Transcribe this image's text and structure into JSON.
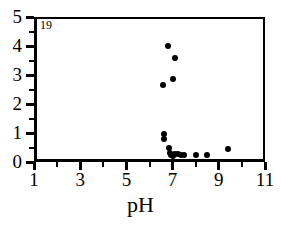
{
  "chart_data": {
    "type": "scatter",
    "title": "",
    "panel_label": "19",
    "xlabel": "pH",
    "ylabel": "",
    "xlim": [
      1,
      11
    ],
    "ylim": [
      0,
      5
    ],
    "grid": false,
    "legend": null,
    "x_ticks_major": [
      1,
      3,
      5,
      7,
      9,
      11
    ],
    "x_ticks_minor": [
      2,
      4,
      6,
      8,
      10
    ],
    "y_ticks_major": [
      0,
      1,
      2,
      3,
      4,
      5
    ],
    "y_ticks_minor": [
      0.5,
      1.5,
      2.5,
      3.5,
      4.5
    ],
    "x_tick_labels": [
      "1",
      "3",
      "5",
      "7",
      "9",
      "11"
    ],
    "y_tick_labels": [
      "0",
      "1",
      "2",
      "3",
      "4",
      "5"
    ],
    "marker": "filled-circle",
    "marker_color": "#000000",
    "points": [
      {
        "x": 6.8,
        "y": 4.0
      },
      {
        "x": 7.1,
        "y": 3.59
      },
      {
        "x": 7.0,
        "y": 2.85
      },
      {
        "x": 6.6,
        "y": 2.66
      },
      {
        "x": 6.62,
        "y": 0.95
      },
      {
        "x": 6.62,
        "y": 0.8
      },
      {
        "x": 6.85,
        "y": 0.5
      },
      {
        "x": 6.88,
        "y": 0.3
      },
      {
        "x": 6.95,
        "y": 0.25
      },
      {
        "x": 7.0,
        "y": 0.22
      },
      {
        "x": 7.1,
        "y": 0.28
      },
      {
        "x": 7.22,
        "y": 0.26
      },
      {
        "x": 7.35,
        "y": 0.25
      },
      {
        "x": 7.5,
        "y": 0.25
      },
      {
        "x": 8.0,
        "y": 0.24
      },
      {
        "x": 8.5,
        "y": 0.24
      },
      {
        "x": 9.4,
        "y": 0.45
      }
    ]
  }
}
